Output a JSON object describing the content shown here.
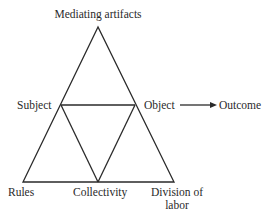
{
  "diagram": {
    "type": "activity-system-triangle",
    "nodes": {
      "top": "Mediating artifacts",
      "left": "Subject",
      "right": "Object",
      "outcome": "Outcome",
      "bottom_left": "Rules",
      "bottom_middle": "Collectivity",
      "bottom_right_line1": "Division of",
      "bottom_right_line2": "labor"
    },
    "edges": [
      {
        "from": "Mediating artifacts",
        "to": "Subject"
      },
      {
        "from": "Mediating artifacts",
        "to": "Object"
      },
      {
        "from": "Subject",
        "to": "Object"
      },
      {
        "from": "Subject",
        "to": "Rules"
      },
      {
        "from": "Subject",
        "to": "Collectivity"
      },
      {
        "from": "Object",
        "to": "Collectivity"
      },
      {
        "from": "Object",
        "to": "Division of labor"
      },
      {
        "from": "Rules",
        "to": "Collectivity"
      },
      {
        "from": "Collectivity",
        "to": "Division of labor"
      },
      {
        "from": "Object",
        "to": "Outcome",
        "arrow": true
      }
    ],
    "line_color": "#2a2a2a"
  }
}
